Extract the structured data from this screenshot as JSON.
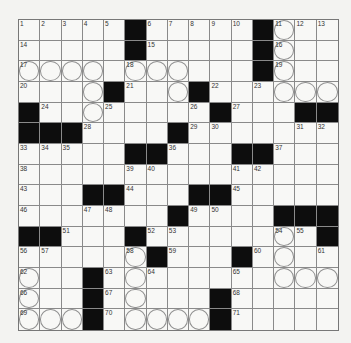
{
  "puzzle": {
    "rows": 15,
    "cols": 15,
    "grid": [
      ".....#.....#...",
      ".....#.....#...",
      "...........#...",
      "....#...#......",
      "#........#...##",
      "###....#.......",
      ".....##...##...",
      "...............",
      "...##...##.....",
      ".......#....###",
      "##...#........#",
      "......#...#....",
      "...#...........",
      "...#.....#.....",
      "...#.....#....."
    ],
    "numbers": [
      {
        "n": "1",
        "r": 0,
        "c": 0
      },
      {
        "n": "2",
        "r": 0,
        "c": 1
      },
      {
        "n": "3",
        "r": 0,
        "c": 2
      },
      {
        "n": "4",
        "r": 0,
        "c": 3
      },
      {
        "n": "5",
        "r": 0,
        "c": 4
      },
      {
        "n": "6",
        "r": 0,
        "c": 6
      },
      {
        "n": "7",
        "r": 0,
        "c": 7
      },
      {
        "n": "8",
        "r": 0,
        "c": 8
      },
      {
        "n": "9",
        "r": 0,
        "c": 9
      },
      {
        "n": "10",
        "r": 0,
        "c": 10
      },
      {
        "n": "11",
        "r": 0,
        "c": 12
      },
      {
        "n": "12",
        "r": 0,
        "c": 13
      },
      {
        "n": "13",
        "r": 0,
        "c": 14
      },
      {
        "n": "14",
        "r": 1,
        "c": 0
      },
      {
        "n": "15",
        "r": 1,
        "c": 6
      },
      {
        "n": "16",
        "r": 1,
        "c": 12
      },
      {
        "n": "17",
        "r": 2,
        "c": 0
      },
      {
        "n": "18",
        "r": 2,
        "c": 5
      },
      {
        "n": "19",
        "r": 2,
        "c": 12
      },
      {
        "n": "20",
        "r": 3,
        "c": 0
      },
      {
        "n": "21",
        "r": 3,
        "c": 5
      },
      {
        "n": "22",
        "r": 3,
        "c": 9
      },
      {
        "n": "23",
        "r": 3,
        "c": 11
      },
      {
        "n": "24",
        "r": 4,
        "c": 1
      },
      {
        "n": "25",
        "r": 4,
        "c": 4
      },
      {
        "n": "26",
        "r": 4,
        "c": 8
      },
      {
        "n": "27",
        "r": 4,
        "c": 10
      },
      {
        "n": "28",
        "r": 5,
        "c": 3
      },
      {
        "n": "29",
        "r": 5,
        "c": 8
      },
      {
        "n": "30",
        "r": 5,
        "c": 9
      },
      {
        "n": "31",
        "r": 5,
        "c": 13
      },
      {
        "n": "32",
        "r": 5,
        "c": 14
      },
      {
        "n": "33",
        "r": 6,
        "c": 0
      },
      {
        "n": "34",
        "r": 6,
        "c": 1
      },
      {
        "n": "35",
        "r": 6,
        "c": 2
      },
      {
        "n": "36",
        "r": 6,
        "c": 7
      },
      {
        "n": "37",
        "r": 6,
        "c": 12
      },
      {
        "n": "38",
        "r": 7,
        "c": 0
      },
      {
        "n": "39",
        "r": 7,
        "c": 5
      },
      {
        "n": "40",
        "r": 7,
        "c": 6
      },
      {
        "n": "41",
        "r": 7,
        "c": 10
      },
      {
        "n": "42",
        "r": 7,
        "c": 11
      },
      {
        "n": "43",
        "r": 8,
        "c": 0
      },
      {
        "n": "44",
        "r": 8,
        "c": 5
      },
      {
        "n": "45",
        "r": 8,
        "c": 10
      },
      {
        "n": "46",
        "r": 9,
        "c": 0
      },
      {
        "n": "47",
        "r": 9,
        "c": 3
      },
      {
        "n": "48",
        "r": 9,
        "c": 4
      },
      {
        "n": "49",
        "r": 9,
        "c": 8
      },
      {
        "n": "50",
        "r": 9,
        "c": 9
      },
      {
        "n": "51",
        "r": 10,
        "c": 2
      },
      {
        "n": "52",
        "r": 10,
        "c": 6
      },
      {
        "n": "53",
        "r": 10,
        "c": 7
      },
      {
        "n": "54",
        "r": 10,
        "c": 12
      },
      {
        "n": "55",
        "r": 10,
        "c": 13
      },
      {
        "n": "56",
        "r": 11,
        "c": 0
      },
      {
        "n": "57",
        "r": 11,
        "c": 1
      },
      {
        "n": "58",
        "r": 11,
        "c": 5
      },
      {
        "n": "59",
        "r": 11,
        "c": 7
      },
      {
        "n": "60",
        "r": 11,
        "c": 11
      },
      {
        "n": "61",
        "r": 11,
        "c": 14
      },
      {
        "n": "62",
        "r": 12,
        "c": 0
      },
      {
        "n": "63",
        "r": 12,
        "c": 4
      },
      {
        "n": "64",
        "r": 12,
        "c": 6
      },
      {
        "n": "65",
        "r": 12,
        "c": 10
      },
      {
        "n": "66",
        "r": 13,
        "c": 0
      },
      {
        "n": "67",
        "r": 13,
        "c": 4
      },
      {
        "n": "68",
        "r": 13,
        "c": 10
      },
      {
        "n": "69",
        "r": 14,
        "c": 0
      },
      {
        "n": "70",
        "r": 14,
        "c": 4
      },
      {
        "n": "71",
        "r": 14,
        "c": 10
      }
    ],
    "circles": [
      [
        0,
        12
      ],
      [
        1,
        12
      ],
      [
        2,
        0
      ],
      [
        2,
        1
      ],
      [
        2,
        2
      ],
      [
        2,
        3
      ],
      [
        2,
        5
      ],
      [
        2,
        6
      ],
      [
        2,
        7
      ],
      [
        2,
        12
      ],
      [
        3,
        3
      ],
      [
        3,
        7
      ],
      [
        3,
        12
      ],
      [
        3,
        13
      ],
      [
        3,
        14
      ],
      [
        4,
        3
      ],
      [
        10,
        12
      ],
      [
        11,
        5
      ],
      [
        11,
        12
      ],
      [
        12,
        0
      ],
      [
        12,
        5
      ],
      [
        12,
        12
      ],
      [
        12,
        13
      ],
      [
        12,
        14
      ],
      [
        13,
        0
      ],
      [
        13,
        5
      ],
      [
        14,
        0
      ],
      [
        14,
        1
      ],
      [
        14,
        2
      ],
      [
        14,
        5
      ],
      [
        14,
        6
      ],
      [
        14,
        7
      ],
      [
        14,
        8
      ]
    ]
  }
}
